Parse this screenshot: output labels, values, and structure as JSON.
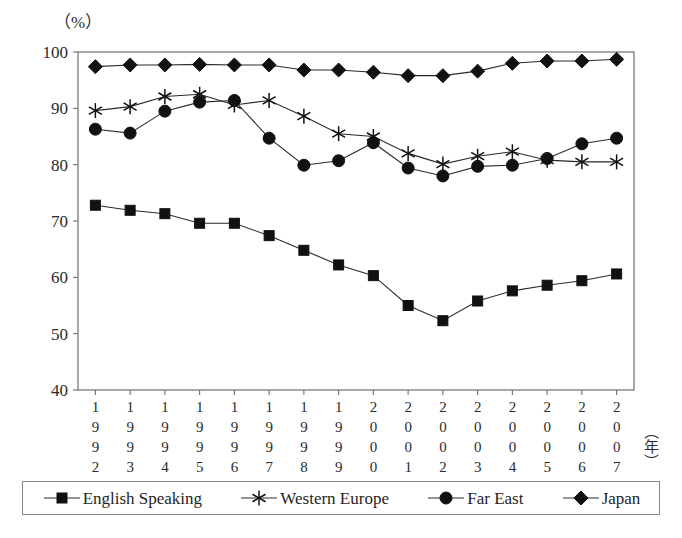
{
  "figure": {
    "unit_label": "（%）",
    "x_axis_unit": "（年）",
    "background": "#ffffff",
    "line_color": "#2a2a2a",
    "frame_color": "#6f6f6f"
  },
  "legend": {
    "items": [
      {
        "label": "English Speaking",
        "marker": "square",
        "icon": "square-marker-icon",
        "color": "#111111"
      },
      {
        "label": "Western Europe",
        "marker": "star",
        "icon": "star-marker-icon",
        "color": "#111111"
      },
      {
        "label": "Far East",
        "marker": "circle",
        "icon": "circle-marker-icon",
        "color": "#111111"
      },
      {
        "label": "Japan",
        "marker": "diamond",
        "icon": "diamond-marker-icon",
        "color": "#111111"
      }
    ]
  },
  "chart_data": {
    "type": "line",
    "title": "",
    "xlabel": "（年）",
    "ylabel": "（%）",
    "ylim": [
      40,
      100
    ],
    "yticks": [
      40,
      50,
      60,
      70,
      80,
      90,
      100
    ],
    "grid": false,
    "legend_position": "bottom",
    "categories": [
      "1992",
      "1993",
      "1994",
      "1995",
      "1996",
      "1997",
      "1998",
      "1999",
      "2000",
      "2001",
      "2002",
      "2003",
      "2004",
      "2005",
      "2006",
      "2007"
    ],
    "series": [
      {
        "name": "English Speaking",
        "marker": "square",
        "values": [
          72.8,
          71.9,
          71.3,
          69.6,
          69.6,
          67.4,
          64.8,
          62.2,
          60.3,
          55.0,
          52.3,
          55.8,
          57.6,
          58.6,
          59.4,
          60.6
        ]
      },
      {
        "name": "Western Europe",
        "marker": "star",
        "values": [
          89.6,
          90.3,
          92.1,
          92.5,
          90.6,
          91.4,
          88.6,
          85.5,
          85.0,
          82.0,
          80.1,
          81.5,
          82.3,
          80.8,
          80.5,
          80.5
        ]
      },
      {
        "name": "Far East",
        "marker": "circle",
        "values": [
          86.3,
          85.6,
          89.5,
          91.1,
          91.4,
          84.7,
          79.9,
          80.7,
          83.9,
          79.4,
          78.0,
          79.7,
          79.9,
          81.1,
          83.7,
          84.7
        ]
      },
      {
        "name": "Japan",
        "marker": "diamond",
        "values": [
          97.4,
          97.7,
          97.7,
          97.8,
          97.7,
          97.7,
          96.8,
          96.8,
          96.4,
          95.8,
          95.8,
          96.6,
          98.0,
          98.4,
          98.4,
          98.7
        ]
      }
    ]
  }
}
